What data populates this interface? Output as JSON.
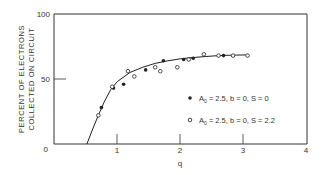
{
  "chart_data": {
    "type": "scatter",
    "title": "",
    "xlabel": "q",
    "ylabel": "PERCENT OF ELECTRONS COLLECTED ON CIRCUIT",
    "ylabel_lines": [
      "PERCENT OF ELECTRONS",
      "COLLECTED ON CIRCUIT"
    ],
    "xlim": [
      0,
      4
    ],
    "ylim": [
      0,
      100
    ],
    "x_ticks": [
      "0",
      "1",
      "2",
      "3",
      "4"
    ],
    "y_ticks": [
      "0",
      "50",
      "100"
    ],
    "grid": false,
    "legend_position": "lower-right inside",
    "series": [
      {
        "name": "A0 = 2.5, b = 0, S = 0",
        "marker": "filled-circle",
        "x": [
          0.75,
          0.94,
          1.1,
          1.45,
          1.73,
          2.05,
          2.2,
          2.68
        ],
        "y": [
          28,
          43,
          46,
          57,
          64,
          65,
          66,
          68
        ]
      },
      {
        "name": "A0 = 2.5, b = 0, S = 2.2",
        "marker": "open-circle",
        "x": [
          0.7,
          0.92,
          1.17,
          1.27,
          1.6,
          1.68,
          1.95,
          2.13,
          2.37,
          2.6,
          2.83,
          3.06
        ],
        "y": [
          22,
          44,
          56,
          52,
          59,
          56,
          59,
          65,
          69,
          68,
          68,
          68
        ]
      },
      {
        "name": "fitted curve",
        "marker": "line",
        "x": [
          0.52,
          0.6,
          0.7,
          0.8,
          0.9,
          1.0,
          1.2,
          1.4,
          1.6,
          1.8,
          2.0,
          2.2,
          2.4,
          2.6,
          2.8,
          3.06
        ],
        "y": [
          0,
          10,
          22,
          33,
          42,
          48,
          55,
          59,
          62,
          64,
          65.5,
          66.5,
          67.3,
          68,
          68.3,
          68.5
        ]
      }
    ]
  },
  "legend": {
    "items": [
      {
        "symbol": "●",
        "a_label": "A",
        "a_sub": "0",
        "rest": " = 2.5,  b = 0,  S = 0"
      },
      {
        "symbol": "○",
        "a_label": "A",
        "a_sub": "0",
        "rest": " = 2.5,  b = 0,  S = 2.2"
      }
    ]
  },
  "axes": {
    "x_title": "q",
    "y_title_line1": "PERCENT OF ELECTRONS",
    "y_title_line2": "COLLECTED ON CIRCUIT",
    "x_tick_labels": [
      "1",
      "2",
      "3",
      "4"
    ],
    "y_tick_labels": {
      "zero": "0",
      "fifty": "50",
      "hundred": "100"
    }
  },
  "colors": {
    "ink": "#333333",
    "background": "#ffffff"
  }
}
